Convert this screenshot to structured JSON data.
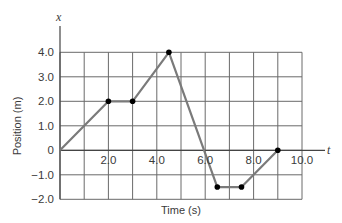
{
  "chart_data": {
    "type": "line",
    "title": "",
    "xlabel": "Time (s)",
    "ylabel": "Position (m)",
    "x_axis_variable": "t",
    "y_axis_variable": "x",
    "xlim": [
      0,
      10
    ],
    "ylim": [
      -2,
      4
    ],
    "grid": true,
    "grid_step_x": 1,
    "grid_step_y": 1,
    "x_ticks": [
      2,
      4,
      6,
      8,
      10
    ],
    "x_tick_labels": [
      "2.0",
      "4.0",
      "6.0",
      "8.0",
      "10.0"
    ],
    "y_ticks": [
      4,
      3,
      2,
      1,
      0,
      -1,
      -2
    ],
    "y_tick_labels": [
      "4.0",
      "3.0",
      "2.0",
      "1.0",
      "0",
      "−1.0",
      "−2.0"
    ],
    "series": [
      {
        "name": "position",
        "x": [
          0,
          2,
          3,
          4.5,
          6.5,
          7.5,
          9
        ],
        "y": [
          0,
          2,
          2,
          4,
          -1.5,
          -1.5,
          0
        ],
        "markers_at": [
          2,
          3,
          4.5,
          6.5,
          7.5,
          9
        ]
      }
    ],
    "colors": {
      "line": "#7a7a7a",
      "grid": "#6a6a6a",
      "marker": "#000000",
      "text": "#3a3a3a"
    },
    "legend": null
  }
}
